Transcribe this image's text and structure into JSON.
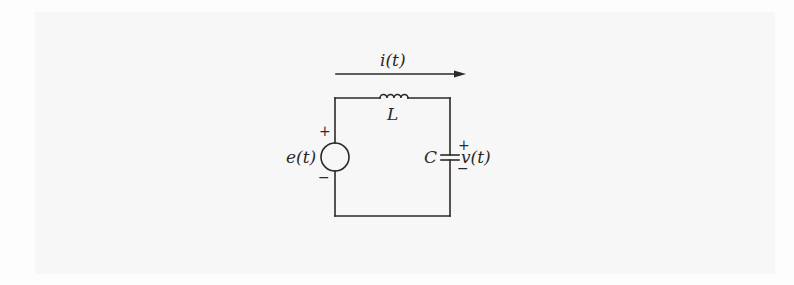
{
  "diagram": {
    "type": "LC circuit schematic",
    "current": {
      "label": "i(t)",
      "direction": "right"
    },
    "components": {
      "source": {
        "symbol": "voltage-source",
        "label": "e(t)",
        "plus": "+",
        "minus": "−"
      },
      "inductor": {
        "symbol": "inductor",
        "label": "L"
      },
      "capacitor": {
        "symbol": "capacitor",
        "label": "C",
        "voltage_label": "v(t)",
        "plus": "+",
        "minus": "−"
      }
    },
    "colors": {
      "ink": "#2a2a2a",
      "background": "#f7f7f7"
    }
  }
}
